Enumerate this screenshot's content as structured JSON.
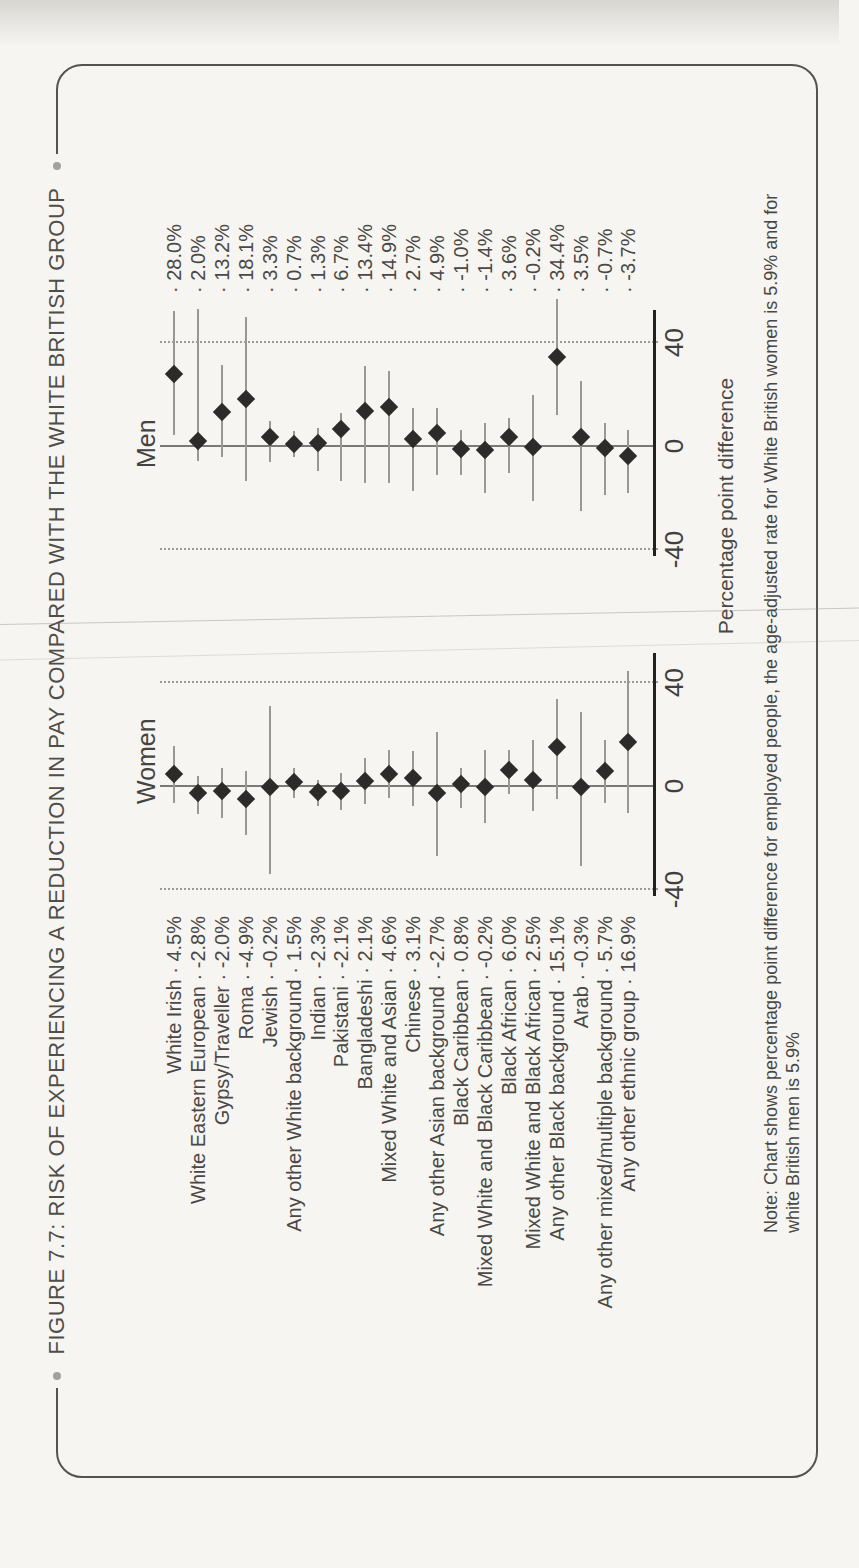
{
  "figure": {
    "title": "FIGURE 7.7: RISK OF EXPERIENCING A REDUCTION IN PAY COMPARED WITH THE WHITE BRITISH GROUP",
    "note_line1": "Note: Chart shows percentage point difference for employed people, the age-adjusted rate for White British women is 5.9% and for",
    "note_line2": "white British men is 5.9%"
  },
  "chart_data": {
    "type": "scatter",
    "subtype": "dot-plot-with-confidence-intervals",
    "panels": [
      "Women",
      "Men"
    ],
    "xlabel": "Percentage point difference",
    "x_ticks": [
      -40,
      0,
      40
    ],
    "x_tick_labels": [
      "-40",
      "0",
      "40"
    ],
    "xlim": [
      -42.5,
      52.5
    ],
    "grid": "dotted gridlines at -40 and +40, solid gray line at 0",
    "legend_position": "none",
    "separator": "·",
    "categories": [
      "White Irish",
      "White Eastern European",
      "Gypsy/Traveller",
      "Roma",
      "Jewish",
      "Any other White background",
      "Indian",
      "Pakistani",
      "Bangladeshi",
      "Mixed White and Asian",
      "Chinese",
      "Any other Asian background",
      "Black Caribbean",
      "Mixed White and Black Caribbean",
      "Black African",
      "Mixed White and Black African",
      "Any other Black background",
      "Arab",
      "Any other mixed/multiple background",
      "Any other ethnic group"
    ],
    "series": [
      {
        "name": "Women",
        "values": [
          4.5,
          -2.8,
          -2.0,
          -4.9,
          -0.2,
          1.5,
          -2.3,
          -2.1,
          2.1,
          4.6,
          3.1,
          -2.7,
          0.8,
          -0.2,
          6.0,
          2.5,
          15.1,
          -0.3,
          5.7,
          16.9
        ],
        "value_labels": [
          "4.5%",
          "-2.8%",
          "-2.0%",
          "-4.9%",
          "-0.2%",
          "1.5%",
          "-2.3%",
          "-2.1%",
          "2.1%",
          "4.6%",
          "3.1%",
          "-2.7%",
          "0.8%",
          "-0.2%",
          "6.0%",
          "2.5%",
          "15.1%",
          "-0.3%",
          "5.7%",
          "16.9%"
        ],
        "ci_low": [
          -6.5,
          -11.0,
          -12.3,
          -18.8,
          -34.0,
          -4.6,
          -7.7,
          -9.2,
          -6.9,
          -4.6,
          -7.7,
          -27.0,
          -8.5,
          -14.4,
          -2.9,
          -9.8,
          -5.2,
          -30.8,
          -6.6,
          -10.4
        ],
        "ci_high": [
          15.4,
          4.0,
          6.9,
          5.8,
          31.0,
          6.9,
          2.3,
          5.0,
          10.7,
          13.8,
          13.4,
          21.0,
          6.9,
          14.0,
          14.0,
          17.8,
          33.6,
          28.5,
          17.8,
          44.5
        ]
      },
      {
        "name": "Men",
        "values": [
          28.0,
          2.0,
          13.2,
          18.1,
          3.3,
          0.7,
          1.3,
          6.7,
          13.4,
          14.9,
          2.7,
          4.9,
          -1.0,
          -1.4,
          3.6,
          -0.2,
          34.4,
          3.5,
          -0.7,
          -3.7
        ],
        "value_labels": [
          "28.0%",
          "2.0%",
          "13.2%",
          "18.1%",
          "3.3%",
          "0.7%",
          "1.3%",
          "6.7%",
          "13.4%",
          "14.9%",
          "2.7%",
          "4.9%",
          "-1.0%",
          "-1.4%",
          "3.6%",
          "-0.2%",
          "34.4%",
          "3.5%",
          "-0.7%",
          "-3.7%"
        ],
        "ci_low": [
          4.3,
          -5.8,
          -4.4,
          -13.4,
          -6.3,
          -4.4,
          -9.7,
          -13.5,
          -14.3,
          -14.3,
          -17.4,
          -11.2,
          -11.2,
          -18.2,
          -10.4,
          -21.3,
          12.0,
          -25.2,
          -19.0,
          -18.2
        ],
        "ci_high": [
          52.0,
          53.0,
          31.3,
          50.0,
          9.8,
          5.7,
          6.9,
          12.7,
          30.9,
          29.0,
          14.7,
          14.7,
          6.2,
          8.9,
          10.8,
          19.7,
          57.0,
          25.2,
          8.9,
          6.2
        ]
      }
    ],
    "colors": {
      "marker": "#2d2b29",
      "ci_line": "#9a9894",
      "zero_line": "#7b7975",
      "axis": "#23211f",
      "dotted_grid": "#9d9b97",
      "text": "#4a4846",
      "border": "#55534f"
    }
  }
}
